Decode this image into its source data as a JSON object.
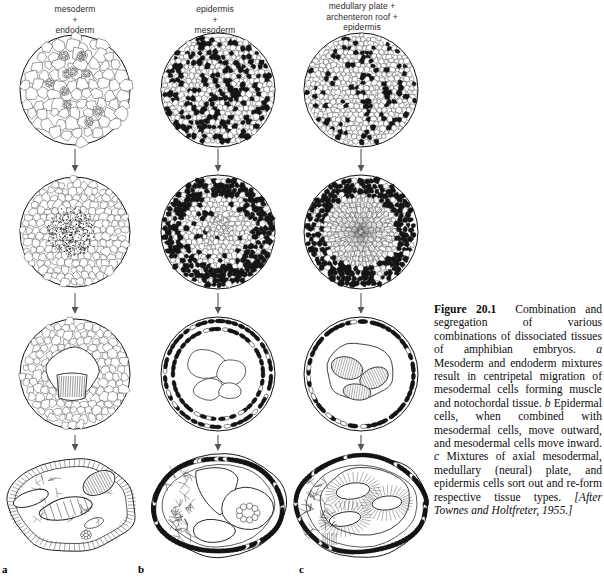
{
  "figure": {
    "number": "Figure 20.1",
    "columns": [
      {
        "id": "a",
        "label": "a",
        "header_lines": [
          "mesoderm",
          "+",
          "endoderm"
        ]
      },
      {
        "id": "b",
        "label": "b",
        "header_lines": [
          "epidermis",
          "+",
          "mesoderm"
        ]
      },
      {
        "id": "c",
        "label": "c",
        "header_lines": [
          "medullary plate +",
          "archenteron roof +",
          "epidermis"
        ]
      }
    ],
    "caption": {
      "title": "Figure 20.1",
      "body_1": "Combination and segregation of various combinations of dissociated tissues of amphibian embryos.",
      "marker_a": "a",
      "body_a": "Mesoderm and endoderm mixtures result in centripetal migration of mesodermal cells forming muscle and notochordal tissue.",
      "marker_b": "b",
      "body_b": "Epidermal cells, when combined with mesodermal cells, move outward, and mesodermal cells move inward.",
      "marker_c": "c",
      "body_c": "Mixtures of axial mesodermal, medullary (neural) plate, and epidermis cells sort out and re-form respective tissue types.",
      "source": "[After Townes and Holtfreter, 1955.]"
    },
    "arrows": {
      "direction": "down",
      "count_per_column": 3,
      "name": "progression-arrow"
    },
    "stages": [
      {
        "row": 1,
        "a": "randomly mixed aggregate, large pale endoderm cells with small dark mesoderm clusters",
        "b": "randomly mixed aggregate, dense salt-and-pepper of dark epidermis and pale mesoderm cells",
        "c": "randomly mixed aggregate of three cell types, scattered dark epidermis among pale cells"
      },
      {
        "row": 2,
        "a": "mesodermal cells migrating centripetally into a dense central core",
        "b": "dark epidermal cells moved outward forming rim, pale mesoderm gathered inside",
        "c": "dark epidermis at periphery, radiating pale medullary and mesodermal core"
      },
      {
        "row": 3,
        "a": "internal striated muscle and notochordal tissue forming inside pale endoderm",
        "b": "dark epidermal shell enclosing segregated internal mesodermal cavities",
        "c": "outer epidermal shell with internal sorted neural and mesodermal masses"
      },
      {
        "row": 4,
        "a": "final irregular aggregate: epithelial border with internal notochord and muscle masses",
        "b": "final aggregate: dark epidermal surface layer over mesodermal cavities and loose cells",
        "c": "final aggregate: epidermis outside, medullary plate and axial mesoderm sorted inside"
      }
    ],
    "colors": {
      "ink": "#111111",
      "dark_cell": "#151515",
      "light_cell": "#ffffff",
      "outline": "#333333",
      "header_text": "#2a2a2a",
      "background": "#ffffff"
    }
  }
}
